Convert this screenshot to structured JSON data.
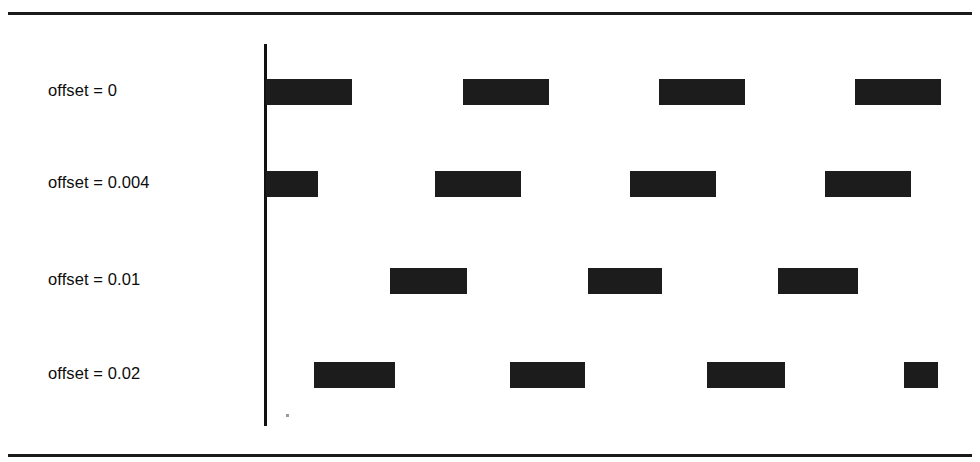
{
  "figure": {
    "background_color": "#ffffff",
    "bar_color": "#1c1c1c",
    "rule_color": "#1a1a1a",
    "axis_color": "#111111"
  },
  "chart_data": {
    "type": "bar",
    "orientation": "horizontal-grouped-rows",
    "title": "",
    "subtitle": "",
    "xlabel": "",
    "ylabel": "",
    "legend": [],
    "grid": false,
    "axis_x_position_px": 265,
    "categories": [
      "offset = 0",
      "offset = 0.004",
      "offset = 0.01",
      "offset = 0.02"
    ],
    "rows": [
      {
        "label": "offset = 0",
        "bar_count": 4,
        "bars_px": [
          {
            "start": 266,
            "end": 352,
            "width": 86
          },
          {
            "start": 463,
            "end": 549,
            "width": 86
          },
          {
            "start": 659,
            "end": 745,
            "width": 86
          },
          {
            "start": 855,
            "end": 941,
            "width": 86
          }
        ]
      },
      {
        "label": "offset = 0.004",
        "bar_count": 4,
        "bars_px": [
          {
            "start": 266,
            "end": 318,
            "width": 52
          },
          {
            "start": 435,
            "end": 521,
            "width": 86
          },
          {
            "start": 630,
            "end": 716,
            "width": 86
          },
          {
            "start": 825,
            "end": 911,
            "width": 86
          }
        ]
      },
      {
        "label": "offset = 0.01",
        "bar_count": 3,
        "bars_px": [
          {
            "start": 390,
            "end": 467,
            "width": 77
          },
          {
            "start": 588,
            "end": 662,
            "width": 74
          },
          {
            "start": 778,
            "end": 858,
            "width": 80
          }
        ]
      },
      {
        "label": "offset = 0.02",
        "bar_count": 4,
        "bars_px": [
          {
            "start": 314,
            "end": 395,
            "width": 81
          },
          {
            "start": 510,
            "end": 585,
            "width": 75
          },
          {
            "start": 707,
            "end": 785,
            "width": 78
          },
          {
            "start": 904,
            "end": 938,
            "width": 34
          }
        ]
      }
    ],
    "row_centers_px": [
      92,
      184,
      281,
      375
    ]
  }
}
